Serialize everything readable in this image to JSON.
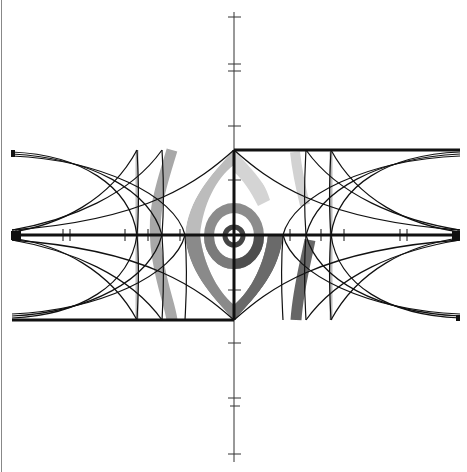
{
  "diagram": {
    "type": "geometric-construction",
    "colors": {
      "background": "#ffffff",
      "line": "#111111",
      "axis": "#333333",
      "gray_light": "#cfcfcf",
      "gray_mid": "#9a9a9a",
      "gray_dark": "#5a5a5a",
      "frame_left": "#888888"
    },
    "center": {
      "x": 234,
      "y": 235
    },
    "box": {
      "left": 12,
      "right": 460,
      "top": 150,
      "bottom": 320
    },
    "vertical_axis": {
      "x": 234,
      "top": 12,
      "bottom": 462,
      "ticks_y": [
        17,
        64,
        71,
        126,
        180,
        290,
        343,
        398,
        406,
        454
      ]
    },
    "horizontal_axis": {
      "y": 235,
      "ticks_x": [
        63,
        70,
        125,
        148,
        180,
        290,
        321,
        344,
        400,
        407
      ]
    },
    "left_curve_columns_x": [
      137,
      162,
      185
    ],
    "right_curve_columns_x": [
      283,
      306,
      331
    ],
    "gray_bands": [
      {
        "name": "left-outer-band",
        "shade": "gray_mid"
      },
      {
        "name": "left-thin-band",
        "shade": "gray_light"
      },
      {
        "name": "right-upper-band",
        "shade": "gray_light"
      },
      {
        "name": "right-lower-band",
        "shade": "gray_dark"
      }
    ]
  }
}
